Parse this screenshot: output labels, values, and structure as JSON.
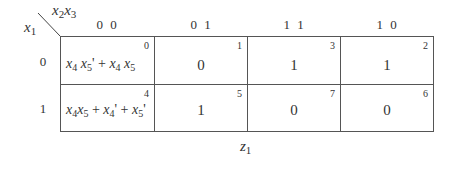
{
  "map": {
    "row_var": "x",
    "row_var_sub": "1",
    "col_var_a": "x",
    "col_var_a_sub": "2",
    "col_var_b": "x",
    "col_var_b_sub": "3",
    "col_headers": [
      "0 0",
      "0 1",
      "1 1",
      "1 0"
    ],
    "row_headers": [
      "0",
      "1"
    ],
    "output_label": "z",
    "output_label_sub": "1",
    "cells": [
      [
        {
          "index": "0",
          "value": "x4 x5' + x4 x5"
        },
        {
          "index": "1",
          "value": "0"
        },
        {
          "index": "3",
          "value": "1"
        },
        {
          "index": "2",
          "value": "1"
        }
      ],
      [
        {
          "index": "4",
          "value": "x4x5 + x4' + x5'"
        },
        {
          "index": "5",
          "value": "1"
        },
        {
          "index": "7",
          "value": "0"
        },
        {
          "index": "6",
          "value": "0"
        }
      ]
    ]
  }
}
